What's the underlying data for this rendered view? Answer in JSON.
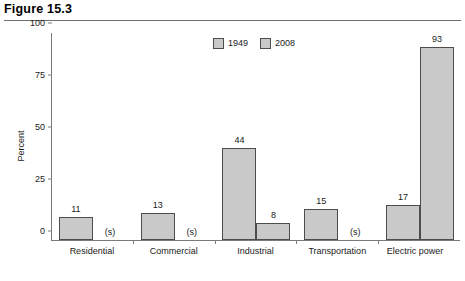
{
  "figure": {
    "title": "Figure 15.3"
  },
  "legend": {
    "position": "top-center",
    "items": [
      {
        "label": "1949",
        "color": "#c9c9c9"
      },
      {
        "label": "2008",
        "color": "#c9c9c9"
      }
    ]
  },
  "axis": {
    "y_label": "Percent",
    "y_ticks": [
      "0",
      "25",
      "50",
      "75",
      "100"
    ],
    "y_min": 0,
    "y_max": 100
  },
  "notes": {
    "suppressed_symbol": "(s)"
  },
  "chart_data": {
    "type": "bar",
    "title": "Figure 15.3",
    "xlabel": "",
    "ylabel": "Percent",
    "ylim": [
      0,
      100
    ],
    "yticks": [
      0,
      25,
      50,
      75,
      100
    ],
    "grid": false,
    "legend_position": "top-center",
    "categories": [
      "Residential",
      "Commercial",
      "Industrial",
      "Transportation",
      "Electric power"
    ],
    "series": [
      {
        "name": "1949",
        "color": "#c9c9c9",
        "values": [
          11,
          13,
          44,
          15,
          17
        ],
        "labels": [
          "11",
          "13",
          "44",
          "15",
          "17"
        ]
      },
      {
        "name": "2008",
        "color": "#c9c9c9",
        "values": [
          null,
          null,
          8,
          null,
          93
        ],
        "labels": [
          "(s)",
          "(s)",
          "8",
          "(s)",
          "93"
        ]
      }
    ],
    "annotations": [
      "(s) denotes a suppressed or negligible value"
    ]
  }
}
